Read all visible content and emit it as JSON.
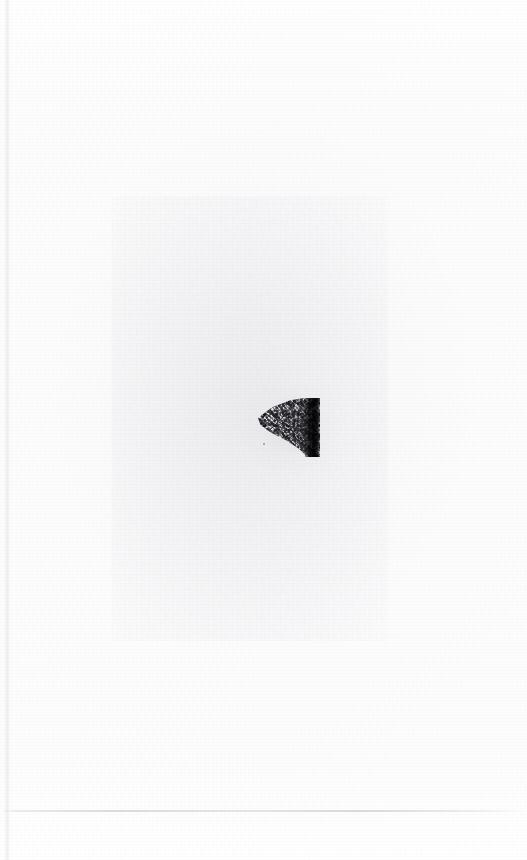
{
  "document": {
    "kind": "scanned-page",
    "title": "Scanned Page",
    "page_width": 527,
    "page_height": 860,
    "background_color": "#fefefe",
    "visible_text": "",
    "notes": "No legible text is present in the scan."
  },
  "regions": {
    "tint_block": {
      "name": "paper-tint-block",
      "description": "Faint rectangular region of slightly grayer paper tone",
      "color": "#f3f3f5",
      "x": 112,
      "y": 196,
      "width": 276,
      "height": 444
    },
    "scan_gutter": {
      "name": "scan-gutter-edge",
      "description": "Faint vertical scanner edge along the left margin",
      "color": "#ebebee",
      "x": 4,
      "y": 0,
      "width": 7,
      "height": 860
    },
    "baseline_rule": {
      "name": "baseline-rule",
      "description": "Faint horizontal line spanning the page near the bottom",
      "color": "#d3d3d8",
      "x": 0,
      "y": 810,
      "width": 527,
      "height": 2
    }
  },
  "ink_mark": {
    "name": "ink-smudge",
    "description": "Grainy dithered wedge tapering to the left with a solid dark vertical bar on the right edge",
    "core_color": "#16161b",
    "stipple_color": "#2e2e34",
    "x": 258,
    "y": 398,
    "width": 62,
    "height": 59,
    "speck": {
      "name": "ink-speck",
      "color": "#78787e",
      "x": 263,
      "y": 443,
      "width": 2,
      "height": 2
    }
  }
}
